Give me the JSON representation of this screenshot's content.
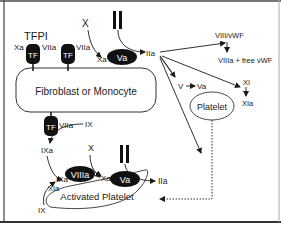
{
  "diagram": {
    "cells": {
      "fibroblast": "Fibroblast or Monocyte",
      "platelet": "Platelet",
      "activated_platelet": "Activated Platelet"
    },
    "receptors": {
      "tf": "TF"
    },
    "labels": {
      "tfpi": "TFPI",
      "xa_left": "Xa",
      "viia_1": "VIIa",
      "viia_2": "VIIa",
      "viia_3": "VIIa",
      "x_top": "X",
      "ii_top": "II",
      "xa_top": "Xa",
      "va_top": "Va",
      "iia_top": "IIa",
      "viii_vwf": "VIII/vWF",
      "viiia_free": "VIIIa + free vWF",
      "v": "V",
      "va_mid": "Va",
      "xi": "XI",
      "xia": "XIa",
      "ix_top": "IX",
      "ixa_left": "IXa",
      "x_bottom": "X",
      "ii_bottom": "II",
      "ixa_bottom": "IXa",
      "viiia_bottom": "VIIIa",
      "xa_bottom": "Xa",
      "va_bottom": "Va",
      "iia_bottom": "IIa",
      "xia_bottom": "XIa",
      "ix_bottom": "IX"
    },
    "colors": {
      "ink": "#1a1a1a",
      "border": "#555555",
      "background": "#ffffff"
    }
  }
}
